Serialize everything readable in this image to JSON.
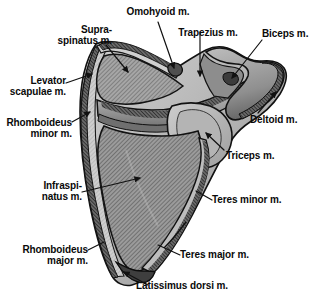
{
  "figure": {
    "view": "posterior",
    "bone": "scapula",
    "style": "grayscale halftone anatomical illustration with diagonal hatching",
    "colors": {
      "background": "#ffffff",
      "outline": "#111111",
      "fossa_hatch_dark": "#6d6d6d",
      "fossa_hatch_light": "#b9b9b9",
      "bone_light": "#c9c9c9",
      "bone_mid": "#9a9a9a",
      "bone_dark": "#5a5a5a",
      "label_text": "#0a0a0a",
      "leader_line": "#111111"
    }
  },
  "labels": [
    {
      "id": "omohyoid",
      "text_lines": [
        "Omohyoid m."
      ],
      "emphasis": "normal"
    },
    {
      "id": "trapezius",
      "text_lines": [
        "Trapezius m."
      ],
      "emphasis": "normal"
    },
    {
      "id": "biceps",
      "text_lines": [
        "Biceps m."
      ],
      "emphasis": "normal"
    },
    {
      "id": "supraspinatus",
      "text_lines": [
        "Supra-",
        "spinatus m."
      ],
      "emphasis": "normal"
    },
    {
      "id": "levator-scapulae",
      "text_lines": [
        "Levator",
        "scapulae m."
      ],
      "emphasis": "normal"
    },
    {
      "id": "rhomboideus-minor",
      "text_lines": [
        "Rhomboideus",
        "minor m."
      ],
      "emphasis": "normal"
    },
    {
      "id": "deltoid",
      "text_lines": [
        "Deltoid m."
      ],
      "emphasis": "bold"
    },
    {
      "id": "triceps",
      "text_lines": [
        "Triceps m."
      ],
      "emphasis": "normal"
    },
    {
      "id": "infraspinatus",
      "text_lines": [
        "Infraspi-",
        "natus m."
      ],
      "emphasis": "normal"
    },
    {
      "id": "teres-minor",
      "text_lines": [
        "Teres minor m."
      ],
      "emphasis": "normal"
    },
    {
      "id": "rhomboideus-major",
      "text_lines": [
        "Rhomboideus",
        "major m."
      ],
      "emphasis": "normal"
    },
    {
      "id": "teres-major",
      "text_lines": [
        "Teres major m."
      ],
      "emphasis": "normal"
    },
    {
      "id": "latissimus-dorsi",
      "text_lines": [
        "Latissimus dorsi m."
      ],
      "emphasis": "normal"
    }
  ],
  "label_text": {
    "omohyoid": "Omohyoid m.",
    "trapezius": "Trapezius m.",
    "biceps": "Biceps m.",
    "supraspinatus_1": "Supra-",
    "supraspinatus_2": "spinatus m.",
    "levator_1": "Levator",
    "levator_2": "scapulae m.",
    "rhomb_minor_1": "Rhomboideus",
    "rhomb_minor_2": "minor m.",
    "deltoid": "Deltoid m.",
    "triceps": "Triceps m.",
    "infraspinatus_1": "Infraspi-",
    "infraspinatus_2": "natus m.",
    "teres_minor": "Teres minor m.",
    "rhomb_major_1": "Rhomboideus",
    "rhomb_major_2": "major m.",
    "teres_major": "Teres major m.",
    "latissimus": "Latissimus dorsi m."
  }
}
